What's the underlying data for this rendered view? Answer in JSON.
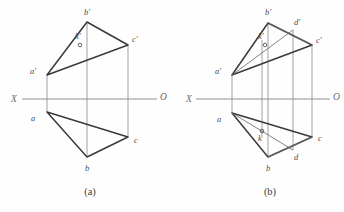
{
  "figure": {
    "background_color": "#fefefe",
    "edge_color": "#3a3a3a",
    "axis_color": "#8f8f8f",
    "projector_color": "#8a8a8a"
  },
  "panels": [
    {
      "id": "a",
      "caption": "(a)",
      "axis": {
        "left_label": "X",
        "right_label": "O"
      },
      "labels": {
        "b_prime": "b'",
        "c_prime": "c'",
        "a_prime": "a'",
        "k_prime": "k'",
        "a": "a",
        "b": "b",
        "c": "c"
      }
    },
    {
      "id": "b",
      "caption": "(b)",
      "axis": {
        "left_label": "X",
        "right_label": "O"
      },
      "labels": {
        "b_prime": "b'",
        "d_prime": "d'",
        "c_prime": "c'",
        "a_prime": "a'",
        "k_prime": "k'",
        "a": "a",
        "k": "k",
        "b": "b",
        "d": "d",
        "c": "c"
      }
    }
  ]
}
